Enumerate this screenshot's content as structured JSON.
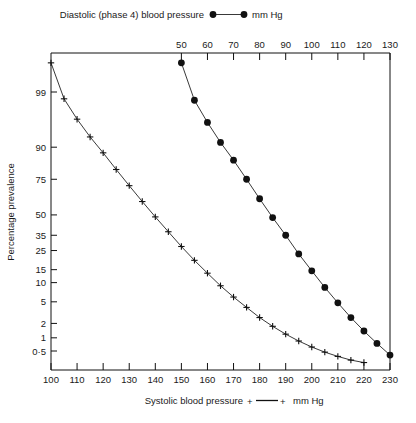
{
  "chart_data": {
    "type": "line",
    "title": "",
    "grid": false,
    "legend_position": "top and bottom",
    "ylabel": "Percentage prevalence",
    "yscale": "probability (probit)",
    "yticks": [
      "99",
      "90",
      "75",
      "50",
      "35",
      "25",
      "15",
      "10",
      "5",
      "2",
      "1",
      "0·5"
    ],
    "ytick_values": [
      99,
      90,
      75,
      50,
      35,
      25,
      15,
      10,
      5,
      2,
      1,
      0.5
    ],
    "ylim": [
      0.25,
      99.85
    ],
    "top_axis": {
      "label": "Diastolic (phase 4) blood pressure ●—● mm Hg",
      "name": "Diastolic (phase 4) blood pressure",
      "units": "mm Hg",
      "marker": "filled-circle",
      "ticks": [
        50,
        60,
        70,
        80,
        90,
        100,
        110,
        120,
        130
      ],
      "ticklabels": [
        "50",
        "60",
        "70",
        "80",
        "90",
        "100",
        "110",
        "120",
        "130"
      ],
      "xlim": [
        0,
        130
      ]
    },
    "bottom_axis": {
      "label": "Systolic blood pressure +—+ mm Hg",
      "name": "Systolic blood pressure",
      "units": "mm Hg",
      "marker": "plus",
      "ticks": [
        100,
        110,
        120,
        130,
        140,
        150,
        160,
        170,
        180,
        190,
        200,
        210,
        220,
        230
      ],
      "ticklabels": [
        "100",
        "110",
        "120",
        "130",
        "140",
        "150",
        "160",
        "170",
        "180",
        "190",
        "200",
        "210",
        "220",
        "230"
      ],
      "xlim": [
        100,
        230
      ]
    },
    "series": [
      {
        "name": "Diastolic (phase 4) blood pressure",
        "marker": "filled-circle",
        "axis": "top",
        "x": [
          50,
          55,
          60,
          65,
          70,
          75,
          80,
          85,
          90,
          95,
          100,
          105,
          110,
          115,
          120,
          125,
          130
        ],
        "values": [
          99.8,
          98.5,
          96.0,
          91.5,
          85.0,
          75.0,
          62.0,
          48.0,
          35.0,
          23.0,
          14.5,
          8.5,
          4.8,
          2.6,
          1.4,
          0.75,
          0.4
        ]
      },
      {
        "name": "Systolic blood pressure",
        "marker": "plus",
        "axis": "bottom",
        "x": [
          100,
          105,
          110,
          115,
          120,
          125,
          130,
          135,
          140,
          145,
          150,
          155,
          160,
          165,
          170,
          175,
          180,
          185,
          190,
          195,
          200,
          205,
          210,
          215,
          220
        ],
        "values": [
          99.8,
          98.6,
          96.5,
          93.0,
          88.0,
          80.5,
          71.0,
          60.0,
          48.5,
          37.5,
          27.5,
          19.5,
          13.5,
          9.0,
          6.0,
          4.0,
          2.6,
          1.75,
          1.2,
          0.85,
          0.62,
          0.47,
          0.37,
          0.3,
          0.26
        ]
      }
    ]
  },
  "legend": {
    "top": {
      "text_before": "Diastolic  (phase 4)  blood  pressure",
      "text_after": "mm Hg"
    },
    "bottom": {
      "text_before": "Systolic  blood  pressure",
      "text_after": "mm Hg"
    }
  },
  "axes": {
    "y_title": "Percentage  prevalence"
  }
}
